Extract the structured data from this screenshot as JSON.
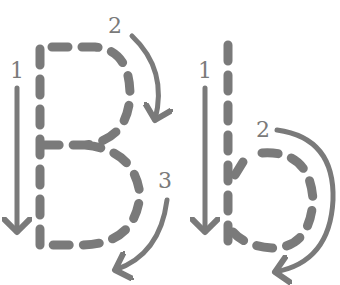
{
  "worksheet": {
    "letters": "Bb",
    "color": "#7a7a7a",
    "uppercase": {
      "letter": "B",
      "steps": [
        {
          "number": "1",
          "direction": "down"
        },
        {
          "number": "2",
          "direction": "clockwise-top-bowl"
        },
        {
          "number": "3",
          "direction": "clockwise-bottom-bowl"
        }
      ]
    },
    "lowercase": {
      "letter": "b",
      "steps": [
        {
          "number": "1",
          "direction": "down"
        },
        {
          "number": "2",
          "direction": "clockwise-bowl"
        }
      ]
    }
  }
}
